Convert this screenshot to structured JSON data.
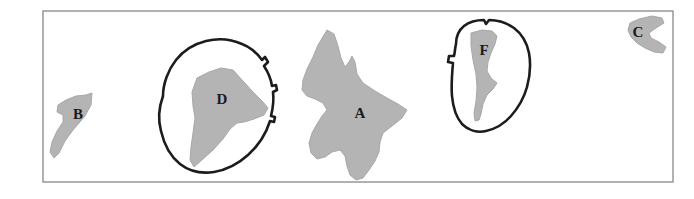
{
  "figure": {
    "background_color": "#ffffff",
    "frame": {
      "name": "map-frame",
      "x": 43,
      "y": 11,
      "width": 630,
      "height": 171,
      "stroke_color": "#909090",
      "stroke_width": 1.4,
      "fill": "none"
    },
    "style": {
      "polygon_fill": "#b4b4b4",
      "polygon_stroke": "#a8a8a8",
      "outline_stroke": "#1c1c1c",
      "outline_stroke_width": 2.6,
      "label_color": "#1a1a1a",
      "label_font_size": 15
    },
    "regions": [
      {
        "id": "region-b",
        "label": "B",
        "label_x": 78,
        "label_y": 116,
        "points": "86,95 92,93 91,105 85,116 73,130 65,141 59,153 54,158 50,152 52,142 57,131 63,122 63,115 57,112 58,105 66,100 76,96"
      },
      {
        "id": "region-d",
        "label": "D",
        "label_x": 222,
        "label_y": 101,
        "points": "197,78 209,72 221,68 233,70 243,81 254,93 263,102 268,108 264,115 254,119 244,122 237,123 230,129 223,139 213,150 203,159 194,167 190,160 191,147 193,133 195,118 193,106 192,92"
      },
      {
        "id": "region-a",
        "label": "A",
        "label_x": 360,
        "label_y": 115,
        "points": "327,30 334,34 338,46 341,58 345,67 349,62 352,56 355,62 357,74 363,83 375,91 387,98 398,104 407,110 402,118 392,126 383,133 380,142 379,152 375,161 369,170 363,178 356,180 350,175 347,166 345,156 340,150 332,152 325,157 317,159 311,153 309,143 312,133 317,124 322,116 327,110 323,103 315,99 307,96 302,90 303,80 307,69 313,57 318,45"
      },
      {
        "id": "region-f",
        "label": "F",
        "label_x": 484,
        "label_y": 52,
        "points": "471,33 482,30 492,31 497,36 495,44 491,53 488,62 487,71 491,78 497,83 493,89 487,95 483,104 481,114 479,120 475,121 474,113 476,101 477,88 476,74 473,60 471,46"
      },
      {
        "id": "region-c",
        "label": "C",
        "label_x": 638,
        "label_y": 34,
        "points": "639,19 652,16 662,18 664,23 656,28 649,33 651,38 659,42 666,47 663,53 654,52 645,48 637,43 631,37 628,30 630,23"
      }
    ],
    "enclosures": [
      {
        "id": "enclosure-d",
        "label": "enclosure-around-d",
        "path": "M 163,96 C 163,84 168,70 176,60 C 183,51 194,44 206,41 C 218,38 231,39 242,44 C 250,47 257,53 262,60 L 265,57 L 268,62 L 264,66 C 268,72 271,79 272,86 L 276,85 L 277,90 L 273,92 C 274,100 273,108 271,116 L 275,117 L 274,122 L 270,121 C 266,134 258,146 248,155 C 238,164 226,170 214,172 C 201,174 189,171 180,164 C 170,156 164,144 161,131 C 158,120 159,107 163,96 Z"
      },
      {
        "id": "enclosure-f",
        "label": "enclosure-around-f",
        "path": "M 456,44 C 456,36 459,30 464,26 C 469,22 476,20 484,20 L 486,24 L 489,20 C 498,20 507,23 514,28 C 522,34 527,43 529,53 C 531,64 530,76 527,87 C 524,98 518,108 511,116 C 504,124 495,129 486,131 C 477,133 468,130 462,124 C 456,117 453,107 452,96 C 451,85 452,74 453,63 L 448,62 L 449,56 L 454,56 C 455,52 455,48 456,44 Z"
      }
    ]
  }
}
